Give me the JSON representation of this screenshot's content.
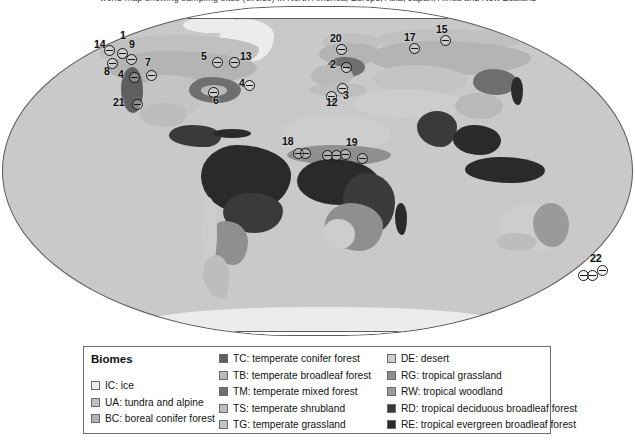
{
  "caption": {
    "text": "world map showing sampling sites (circles) in North America, Europe, Asia, Japan, Africa and New Zealand",
    "truncated": true
  },
  "map": {
    "name": "world-biome-map",
    "projection": "robinson",
    "background_color": "#c9c9c9",
    "outline_color": "#5b5b5b",
    "marker_symbol": "circle-with-horizontal-bar",
    "markers": [
      {
        "id": "14",
        "label": "14",
        "x": 104,
        "y": 41,
        "lx": 94,
        "ly": 35
      },
      {
        "id": "1",
        "label": "1",
        "x": 117,
        "y": 44,
        "lx": 120,
        "ly": 26
      },
      {
        "id": "9",
        "label": "9",
        "x": 126,
        "y": 50,
        "lx": 129,
        "ly": 35
      },
      {
        "id": "8",
        "label": "8",
        "x": 107,
        "y": 54,
        "lx": 104,
        "ly": 62
      },
      {
        "id": "4a",
        "label": "4",
        "x": 129,
        "y": 68,
        "lx": 118,
        "ly": 65
      },
      {
        "id": "7",
        "label": "7",
        "x": 146,
        "y": 66,
        "lx": 145,
        "ly": 53
      },
      {
        "id": "5",
        "label": "5",
        "x": 212,
        "y": 53,
        "lx": 201,
        "ly": 47
      },
      {
        "id": "13",
        "label": "13",
        "x": 229,
        "y": 53,
        "lx": 240,
        "ly": 47
      },
      {
        "id": "6",
        "label": "6",
        "x": 208,
        "y": 83,
        "lx": 213,
        "ly": 91
      },
      {
        "id": "4b",
        "label": "4",
        "x": 244,
        "y": 76,
        "lx": 239,
        "ly": 74
      },
      {
        "id": "21",
        "label": "21",
        "x": 132,
        "y": 95,
        "lx": 113,
        "ly": 93
      },
      {
        "id": "20",
        "label": "20",
        "x": 336,
        "y": 40,
        "lx": 330,
        "ly": 29
      },
      {
        "id": "2",
        "label": "2",
        "x": 341,
        "y": 58,
        "lx": 330,
        "ly": 55
      },
      {
        "id": "3",
        "label": "3",
        "x": 337,
        "y": 79,
        "lx": 343,
        "ly": 86
      },
      {
        "id": "12",
        "label": "12",
        "x": 326,
        "y": 87,
        "lx": 326,
        "ly": 93
      },
      {
        "id": "17",
        "label": "17",
        "x": 409,
        "y": 39,
        "lx": 404,
        "ly": 28
      },
      {
        "id": "15",
        "label": "15",
        "x": 440,
        "y": 31,
        "lx": 436,
        "ly": 20
      },
      {
        "id": "18",
        "label": "18",
        "x": 293,
        "y": 144,
        "lx": 282,
        "ly": 132
      },
      {
        "id": "18b",
        "label": "",
        "x": 300,
        "y": 144,
        "lx": 0,
        "ly": 0
      },
      {
        "id": "19a",
        "label": "",
        "x": 322,
        "y": 146,
        "lx": 0,
        "ly": 0
      },
      {
        "id": "19b",
        "label": "",
        "x": 331,
        "y": 146,
        "lx": 0,
        "ly": 0
      },
      {
        "id": "19c",
        "label": "",
        "x": 340,
        "y": 145,
        "lx": 0,
        "ly": 0
      },
      {
        "id": "19",
        "label": "19",
        "x": 357,
        "y": 149,
        "lx": 346,
        "ly": 133
      },
      {
        "id": "22a",
        "label": "",
        "x": 578,
        "y": 266,
        "lx": 0,
        "ly": 0
      },
      {
        "id": "22b",
        "label": "",
        "x": 587,
        "y": 266,
        "lx": 0,
        "ly": 0
      },
      {
        "id": "22",
        "label": "22",
        "x": 597,
        "y": 261,
        "lx": 590,
        "ly": 249
      }
    ]
  },
  "legend": {
    "title": "Biomes",
    "columns": [
      {
        "name": "column-one",
        "items": [
          {
            "code": "IC",
            "label": "IC: ice",
            "color": "#ececec"
          },
          {
            "code": "UA",
            "label": "UA: tundra and alpine",
            "color": "#c0c0c0"
          },
          {
            "code": "BC",
            "label": "BC: boreal conifer forest",
            "color": "#b4b4b4"
          }
        ]
      },
      {
        "name": "column-two",
        "items": [
          {
            "code": "TC",
            "label": "TC: temperate conifer forest",
            "color": "#5f5f5f"
          },
          {
            "code": "TB",
            "label": "TB: temperate broadleaf forest",
            "color": "#b9b9b9"
          },
          {
            "code": "TM",
            "label": "TM: temperate mixed forest",
            "color": "#6e6e6e"
          },
          {
            "code": "TS",
            "label": "TS: temperate shrubland",
            "color": "#bdbdbd"
          },
          {
            "code": "TG",
            "label": "TG: temperate grassland",
            "color": "#c4c4c4"
          }
        ]
      },
      {
        "name": "column-three",
        "items": [
          {
            "code": "DE",
            "label": "DE: desert",
            "color": "#cdcdcd"
          },
          {
            "code": "RG",
            "label": "RG: tropical grassland",
            "color": "#8f8f8f"
          },
          {
            "code": "RW",
            "label": "RW: tropical woodland",
            "color": "#9a9a9a"
          },
          {
            "code": "RD",
            "label": "RD: tropical deciduous broadleaf forest",
            "color": "#3a3a3a"
          },
          {
            "code": "RE",
            "label": "RE: tropical evergreen broadleaf forest",
            "color": "#2a2a2a"
          }
        ]
      }
    ]
  }
}
